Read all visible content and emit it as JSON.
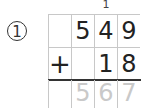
{
  "problem": {
    "number_label": "1",
    "operation": "addition",
    "carry_digits": [
      "",
      "",
      "1",
      ""
    ],
    "addend1": [
      "",
      "5",
      "4",
      "9"
    ],
    "addend2": [
      "+",
      "",
      "1",
      "8"
    ],
    "sum": [
      "",
      "5",
      "6",
      "7"
    ],
    "colors": {
      "ink": "#222222",
      "grid": "#c8c8c8",
      "answer": "#c9c9c9"
    }
  }
}
